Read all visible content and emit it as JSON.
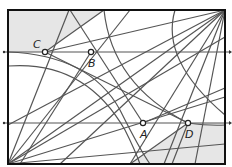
{
  "diagram": {
    "frame": {
      "x1": 8,
      "y1": 10,
      "x2": 225,
      "y2": 164
    },
    "colors": {
      "line": "#555555",
      "frame": "#111111",
      "shade": "#e6e6e6",
      "point_fill": "#ffffff"
    },
    "horizontal_lines": [
      {
        "y": 52,
        "x1": 3,
        "x2": 229
      },
      {
        "y": 123,
        "x1": 3,
        "x2": 229
      }
    ],
    "fan_origins": [
      {
        "name": "bottom-left",
        "x": 8,
        "y": 164
      },
      {
        "name": "top-right",
        "x": 225,
        "y": 10
      }
    ],
    "points": [
      {
        "id": "A",
        "label": "A",
        "x": 143,
        "y": 123,
        "lx": 140,
        "ly": 138
      },
      {
        "id": "B",
        "label": "B",
        "x": 91,
        "y": 52,
        "lx": 88,
        "ly": 67
      },
      {
        "id": "C",
        "label": "C",
        "x": 45,
        "y": 52,
        "lx": 33,
        "ly": 48
      },
      {
        "id": "D",
        "label": "D",
        "x": 188,
        "y": 123,
        "lx": 185,
        "ly": 138
      }
    ]
  }
}
